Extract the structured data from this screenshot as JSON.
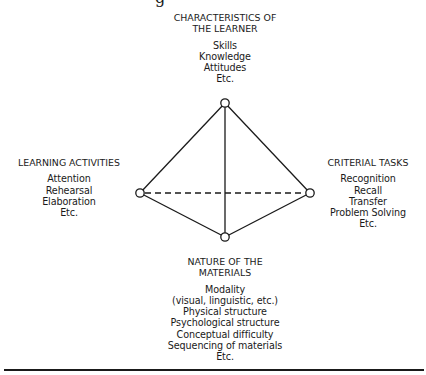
{
  "diagram": {
    "type": "tetrahedral-model",
    "colors": {
      "line": "#1a1a1a",
      "background": "#ffffff"
    },
    "top_fragment": "g",
    "vertices": {
      "top": {
        "x": 225,
        "y": 103
      },
      "left": {
        "x": 140,
        "y": 193
      },
      "right": {
        "x": 310,
        "y": 193
      },
      "bottom": {
        "x": 225,
        "y": 237
      }
    },
    "edges": [
      {
        "from": "top",
        "to": "left",
        "style": "solid"
      },
      {
        "from": "top",
        "to": "right",
        "style": "solid"
      },
      {
        "from": "top",
        "to": "bottom",
        "style": "solid"
      },
      {
        "from": "left",
        "to": "bottom",
        "style": "solid"
      },
      {
        "from": "right",
        "to": "bottom",
        "style": "solid"
      },
      {
        "from": "left",
        "to": "right",
        "style": "dashed"
      }
    ],
    "nodes": {
      "top": {
        "heading": [
          "CHARACTERISTICS OF",
          "THE LEARNER"
        ],
        "items": [
          "Skills",
          "Knowledge",
          "Attitudes",
          "Etc."
        ]
      },
      "left": {
        "heading": [
          "LEARNING ACTIVITIES"
        ],
        "items": [
          "Attention",
          "Rehearsal",
          "Elaboration",
          "Etc."
        ]
      },
      "right": {
        "heading": [
          "CRITERIAL TASKS"
        ],
        "items": [
          "Recognition",
          "Recall",
          "Transfer",
          "Problem Solving",
          "Etc."
        ]
      },
      "bottom": {
        "heading": [
          "NATURE OF THE",
          "MATERIALS"
        ],
        "items": [
          "Modality",
          "(visual, linguistic, etc.)",
          "Physical structure",
          "Psychological structure",
          "Conceptual difficulty",
          "Sequencing of materials",
          "Etc."
        ]
      }
    }
  }
}
